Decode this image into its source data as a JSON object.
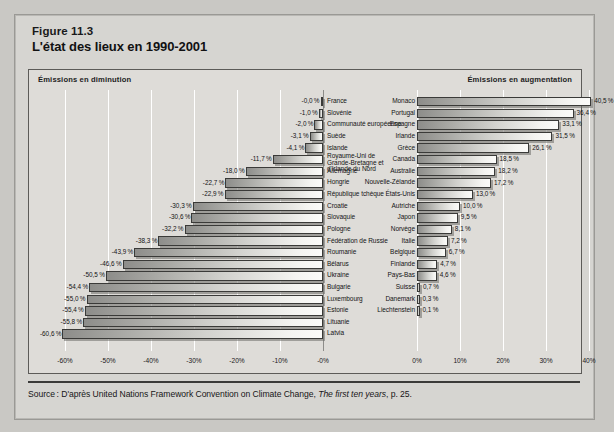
{
  "figure": {
    "number": "Figure 11.3",
    "title": "L'état des lieux en 1990-2001",
    "source_prefix": "Source : D'après United Nations Framework Convention on Climate Change, ",
    "source_italic": "The first ten years",
    "source_suffix": ", p. 25."
  },
  "bands": {
    "left_label": "Émissions en diminution",
    "right_label": "Émissions en augmentation"
  },
  "chart_data": {
    "type": "bar",
    "orientation": "horizontal",
    "title": "L'état des lieux en 1990-2001",
    "subtitle": "Figure 11.3",
    "xlabel": "",
    "ylabel": "",
    "grid": true,
    "legend_position": "none",
    "panels": [
      {
        "name": "left",
        "label": "Émissions en diminution",
        "xlim": [
          -65,
          0
        ],
        "ticks": [
          "-60%",
          "-50%",
          "-40%",
          "-30%",
          "-20%",
          "-10%",
          "-0%"
        ],
        "tick_values": [
          -60,
          -50,
          -40,
          -30,
          -20,
          -10,
          0
        ],
        "categories": [
          "France",
          "Slovénie",
          "Communauté européenne",
          "Suède",
          "Islande",
          "Royaume-Uni de Grande-Bretagne et d'Irlande du Nord",
          "Allemagne",
          "Hongrie",
          "République tchèque",
          "Croatie",
          "Slovaquie",
          "Pologne",
          "Fédération de Russie",
          "Roumanie",
          "Bélarus",
          "Ukraine",
          "Bulgarie",
          "Luxembourg",
          "Estonie",
          "Lituanie",
          "Latvia"
        ],
        "values": [
          -0.0,
          -1.0,
          -2.0,
          -3.1,
          -4.1,
          -11.7,
          -18.0,
          -22.7,
          -22.9,
          -30.3,
          -30.6,
          -32.2,
          -38.3,
          -43.9,
          -46.6,
          -50.5,
          -54.4,
          -55.0,
          -55.4,
          -55.8,
          -60.6
        ],
        "labels": [
          "-0,0 %",
          "-1,0 %",
          "-2,0 %",
          "-3,1 %",
          "-4,1 %",
          "-11,7 %",
          "-18,0 %",
          "-22,7 %",
          "-22,9 %",
          "-30,3 %",
          "-30,6 %",
          "-32,2 %",
          "-38,3 %",
          "-43,9 %",
          "-46,6 %",
          "-50,5 %",
          "-54,4 %",
          "-55,0 %",
          "-55,4 %",
          "-55,8 %",
          "-60,6 %"
        ]
      },
      {
        "name": "right",
        "label": "Émissions en augmentation",
        "xlim": [
          0,
          45
        ],
        "ticks": [
          "0%",
          "10%",
          "20%",
          "30%",
          "40%"
        ],
        "tick_values": [
          0,
          10,
          20,
          30,
          40
        ],
        "categories": [
          "Monaco",
          "Portugal",
          "Espagne",
          "Irlande",
          "Grèce",
          "Canada",
          "Australie",
          "Nouvelle-Zélande",
          "États-Unis",
          "Autriche",
          "Japon",
          "Norvège",
          "Italie",
          "Belgique",
          "Finlande",
          "Pays-Bas",
          "Suisse",
          "Danemark",
          "Liechtenstein"
        ],
        "values": [
          40.5,
          36.4,
          33.1,
          31.5,
          26.1,
          18.5,
          18.2,
          17.2,
          13.0,
          10.0,
          9.5,
          8.1,
          7.2,
          6.7,
          4.7,
          4.6,
          0.7,
          0.3,
          0.1
        ],
        "labels": [
          "40,5 %",
          "36,4 %",
          "33,1 %",
          "31,5 %",
          "26,1 %",
          "18,5 %",
          "18,2 %",
          "17,2 %",
          "13,0 %",
          "10,0 %",
          "9,5 %",
          "8,1 %",
          "7,2 %",
          "6,7 %",
          "4,7 %",
          "4,6 %",
          "0,7 %",
          "0,3 %",
          "0,1 %"
        ]
      }
    ]
  },
  "colors": {
    "page_background": "#c9c8c4",
    "card_background": "#d6d5d1",
    "plot_background": "#dedcd8",
    "bar_outline": "#3a3a38",
    "text": "#131314",
    "gridline": "#ffffff"
  }
}
